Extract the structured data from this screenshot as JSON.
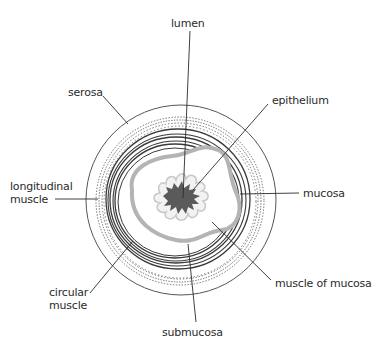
{
  "diagram": {
    "labels": {
      "lumen": "lumen",
      "serosa": "serosa",
      "epithelium": "epithelium",
      "longitudinal_muscle_line1": "longitudinal",
      "longitudinal_muscle_line2": "muscle",
      "mucosa": "mucosa",
      "circular_muscle_line1": "circular",
      "circular_muscle_line2": "muscle",
      "muscle_of_mucosa": "muscle of mucosa",
      "submucosa": "submucosa"
    },
    "colors": {
      "line": "#2b2b2b",
      "lumen_fill": "#5a5a5a",
      "submucosa_band": "#b4b4b4",
      "epithelium_outline": "#c8c8c8",
      "dots": "#555555"
    }
  }
}
